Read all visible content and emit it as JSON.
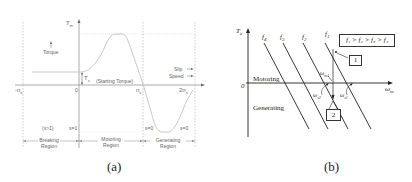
{
  "figure_a": {
    "caption": "(a)",
    "y_axis_label": "T",
    "y_axis_sub": "m",
    "torque_legend": "Torque",
    "starting_torque_symbol": "T",
    "starting_torque_sub": "s",
    "starting_torque_label": "(Starting Torque)",
    "slip_legend": "Slip",
    "speed_legend": "Speed",
    "x_ticks": {
      "neg_ns": "-n",
      "neg_ns_sub": "s",
      "zero": "0",
      "ns": "n",
      "ns_sub": "s",
      "two_ns": "2n",
      "two_ns_sub": "s"
    },
    "slip_values": {
      "braking": "(s>1)",
      "s1": "s=1",
      "s0_left": "s=0",
      "s0_right": "s=0"
    },
    "regions": [
      {
        "line1": "Breaking",
        "line2": "Region"
      },
      {
        "line1": "Motoring",
        "line2": "Region"
      },
      {
        "line1": "Generating",
        "line2": "Region"
      }
    ]
  },
  "figure_b": {
    "caption": "(b)",
    "y_axis_label": "T",
    "y_axis_sub": "e",
    "origin": "0",
    "x_axis_label": "ω",
    "x_axis_sub": "m",
    "freq_labels": [
      {
        "sym": "f",
        "sub": "4"
      },
      {
        "sym": "f",
        "sub": "3"
      },
      {
        "sym": "f",
        "sub": "2"
      },
      {
        "sym": "f",
        "sub": "1"
      }
    ],
    "legend_box": "f₁ > f₂ > f₃ > f₄",
    "motoring_label": "Motoring",
    "generating_label": "Generating",
    "point1_label": "1",
    "point2_label": "2",
    "omega_m1": "ω",
    "omega_m1_sub": "m1",
    "omega_s1": "ω",
    "omega_s1_sub": "s1",
    "omega_s2": "ω",
    "omega_s2_sub": "s2"
  }
}
